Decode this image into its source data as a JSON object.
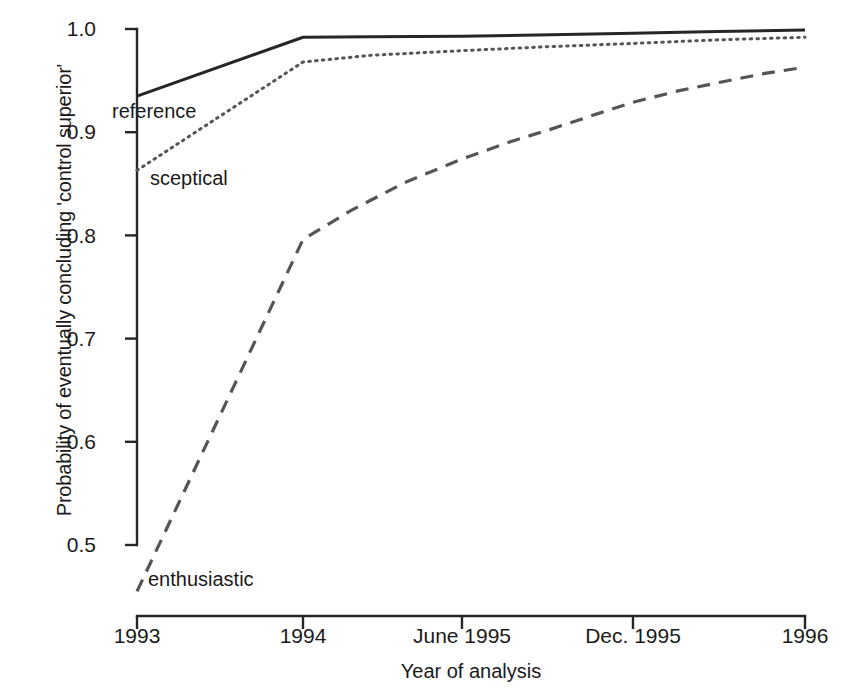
{
  "chart_data": {
    "type": "line",
    "title": "",
    "xlabel": "Year of analysis",
    "ylabel": "Probability of eventually concluding 'control superior'",
    "xlim": [
      0,
      1
    ],
    "ylim": [
      0.45,
      1.0
    ],
    "grid": false,
    "legend_position": "inline-annotations",
    "x_tick_positions": [
      0.0,
      0.2485,
      0.4865,
      0.7425,
      1.0
    ],
    "x_tick_labels": [
      "1993",
      "1994",
      "June 1995",
      "Dec. 1995",
      "1996"
    ],
    "y_tick_positions": [
      0.5,
      0.6,
      0.7,
      0.8,
      0.9,
      1.0
    ],
    "y_tick_labels": [
      "0.5",
      "0.6",
      "0.7",
      "0.8",
      "0.9",
      "1.0"
    ],
    "series": [
      {
        "name": "reference",
        "style": "solid",
        "color": "#262626",
        "x": [
          0.0,
          0.2485,
          0.35,
          0.4865,
          0.62,
          0.7425,
          0.87,
          1.0
        ],
        "values": [
          0.935,
          0.992,
          0.9925,
          0.993,
          0.9945,
          0.996,
          0.9975,
          0.999
        ]
      },
      {
        "name": "sceptical",
        "style": "dotted",
        "color": "#555555",
        "x": [
          0.0,
          0.2485,
          0.35,
          0.4865,
          0.62,
          0.7425,
          0.87,
          1.0
        ],
        "values": [
          0.863,
          0.968,
          0.9745,
          0.979,
          0.983,
          0.986,
          0.9895,
          0.992
        ]
      },
      {
        "name": "enthusiastic",
        "style": "dashed",
        "color": "#555555",
        "x": [
          0.0,
          0.2485,
          0.32,
          0.4,
          0.4865,
          0.56,
          0.62,
          0.69,
          0.7425,
          0.81,
          0.87,
          0.94,
          1.0
        ],
        "values": [
          0.455,
          0.796,
          0.824,
          0.851,
          0.874,
          0.891,
          0.903,
          0.918,
          0.929,
          0.94,
          0.948,
          0.957,
          0.963
        ]
      }
    ],
    "annotations": [
      {
        "text": "reference",
        "x": 0.045,
        "y": 0.915
      },
      {
        "text": "sceptical",
        "x": 0.085,
        "y": 0.845
      },
      {
        "text": "enthusiastic",
        "x": 0.072,
        "y": 0.445
      }
    ]
  },
  "axis": {
    "left_px": 137,
    "right_px": 805,
    "top_px": 29,
    "bottom_px": 616,
    "y_value_top": 1.0,
    "y_value_at_bottom_axis": 0.5
  }
}
